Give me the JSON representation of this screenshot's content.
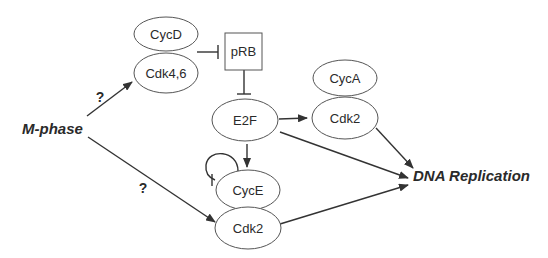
{
  "diagram": {
    "type": "signaling-pathway",
    "nodes": {
      "mphase": {
        "label": "M-phase"
      },
      "cycd": {
        "label": "CycD"
      },
      "cdk46": {
        "label": "Cdk4,6"
      },
      "prb": {
        "label": "pRB"
      },
      "e2f": {
        "label": "E2F"
      },
      "cyca": {
        "label": "CycA"
      },
      "cdk2_a": {
        "label": "Cdk2"
      },
      "cyce": {
        "label": "CycE"
      },
      "cdk2_e": {
        "label": "Cdk2"
      },
      "dna": {
        "label": "DNA Replication"
      }
    },
    "edge_labels": {
      "mphase_to_cdk46": "?",
      "mphase_to_cdk2e": "?"
    },
    "edges": [
      {
        "from": "M-phase",
        "to": "Cdk4,6",
        "type": "activation",
        "label": "?"
      },
      {
        "from": "M-phase",
        "to": "Cdk2 (CycE)",
        "type": "activation",
        "label": "?"
      },
      {
        "from": "CycD/Cdk4,6",
        "to": "pRB",
        "type": "inhibition"
      },
      {
        "from": "pRB",
        "to": "E2F",
        "type": "inhibition"
      },
      {
        "from": "E2F",
        "to": "Cdk2 (CycA)",
        "type": "activation"
      },
      {
        "from": "E2F",
        "to": "CycE",
        "type": "activation"
      },
      {
        "from": "E2F",
        "to": "DNA Replication",
        "type": "activation"
      },
      {
        "from": "CycE",
        "to": "CycE",
        "type": "self-inhibition"
      },
      {
        "from": "CycA/Cdk2",
        "to": "DNA Replication",
        "type": "activation"
      },
      {
        "from": "CycE/Cdk2",
        "to": "DNA Replication",
        "type": "activation"
      }
    ]
  }
}
